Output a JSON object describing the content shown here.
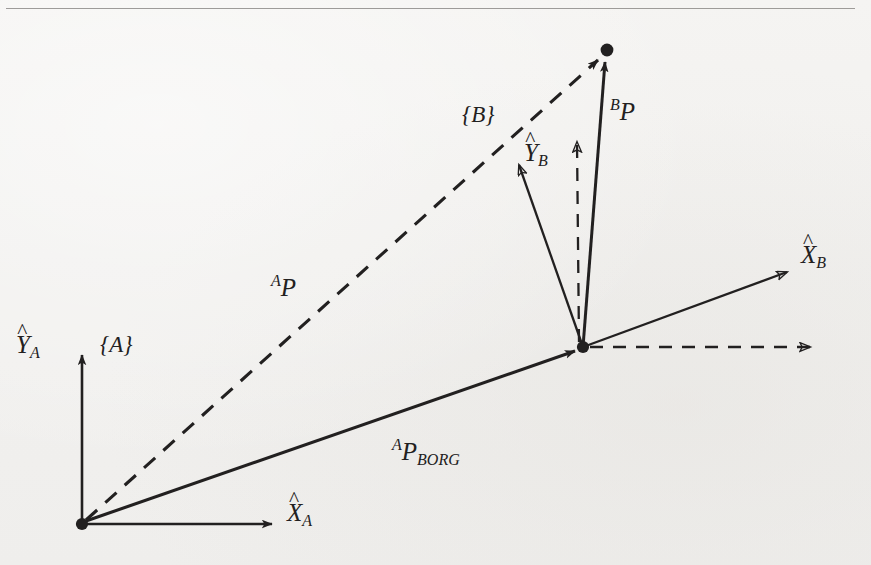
{
  "figure": {
    "kind": "vector-diagram",
    "background_color": "#f2f1ef",
    "ink_color": "#222020",
    "rule_color": "#8d8b88"
  },
  "labels": {
    "frame_a": "{A}",
    "frame_b": "{B}",
    "x_axis_a": {
      "hat": "^",
      "base": "X",
      "sub": "A"
    },
    "y_axis_a": {
      "hat": "^",
      "base": "Y",
      "sub": "A"
    },
    "x_axis_b": {
      "hat": "^",
      "base": "X",
      "sub": "B"
    },
    "y_axis_b": {
      "hat": "^",
      "base": "Y",
      "sub": "B"
    },
    "vector_ap": {
      "sup": "A",
      "base": "P"
    },
    "vector_bp": {
      "sup": "B",
      "base": "P"
    },
    "vector_ap_borg": {
      "sup": "A",
      "base": "P",
      "sub": "BORG"
    }
  },
  "geometry": {
    "origin_a": {
      "x": 82,
      "y": 524
    },
    "origin_b": {
      "x": 583,
      "y": 347
    },
    "point_p": {
      "x": 607,
      "y": 50
    },
    "axis_a_x_end": {
      "x": 282,
      "y": 524
    },
    "axis_a_y_end": {
      "x": 82,
      "y": 345
    },
    "axis_b_x_end": {
      "x": 795,
      "y": 268
    },
    "axis_b_y_end": {
      "x": 514,
      "y": 157
    },
    "dashed_x_end": {
      "x": 820,
      "y": 347
    },
    "dashed_y_end": {
      "x": 578,
      "y": 133
    }
  },
  "vectors": [
    {
      "name": "ap",
      "style": "dashed",
      "from": "origin_a",
      "to": "point_p",
      "arrowhead": "solid"
    },
    {
      "name": "ap-borg",
      "style": "solid",
      "from": "origin_a",
      "to": "origin_b",
      "arrowhead": "solid"
    },
    {
      "name": "bp",
      "style": "solid",
      "from": "origin_b",
      "to": "point_p",
      "arrowhead": "solid"
    }
  ]
}
